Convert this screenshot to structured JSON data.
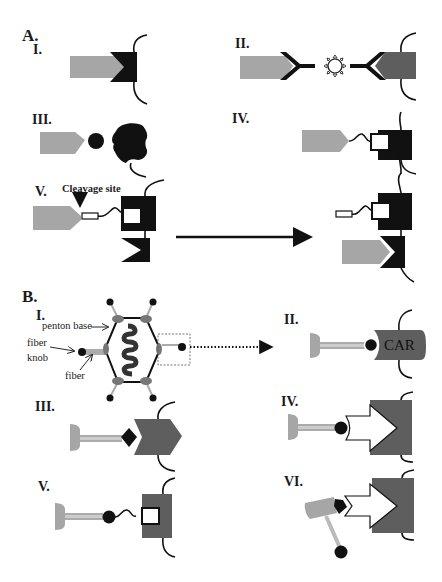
{
  "figure": {
    "sections": [
      {
        "id": "A",
        "label": "A.",
        "panels": [
          {
            "id": "A-I",
            "label": "I.",
            "description": "Light-gray arrow ligand binding into V-notch of black receptor anchored to membrane"
          },
          {
            "id": "A-II",
            "label": "II.",
            "description": "Two Y-shaped antibody adaptors bridging via a central star-shaped molecule between light-gray and dark-gray arrow shapes"
          },
          {
            "id": "A-III",
            "label": "III.",
            "description": "Light-gray arrow with black knob binding a black star-like receptor"
          },
          {
            "id": "A-IV",
            "label": "IV.",
            "description": "Light-gray arrow tethered by a wavy linker to a white square docked in black receptor"
          },
          {
            "id": "A-V",
            "label": "V.",
            "description": "Arrow attached by cleavable linker; cleavage releases ligand which then binds lower receptor"
          }
        ],
        "annotations": {
          "cleavage_site": "Cleavage site"
        }
      },
      {
        "id": "B",
        "label": "B.",
        "panels": [
          {
            "id": "B-I",
            "label": "I.",
            "description": "Adenovirus capsid with genome, penton bases and fibers with knobs"
          },
          {
            "id": "B-II",
            "label": "II.",
            "description": "Fiber knob binding CAR receptor"
          },
          {
            "id": "B-III",
            "label": "III.",
            "description": "Fiber with diamond ligand binding dark-gray chevron receptor"
          },
          {
            "id": "B-IV",
            "label": "IV.",
            "description": "Fiber knob binding an adaptor docked into dark-gray receptor"
          },
          {
            "id": "B-V",
            "label": "V.",
            "description": "Fiber knob tethered via wavy linker to white square docked in dark-gray receptor"
          },
          {
            "id": "B-VI",
            "label": "VI.",
            "description": "Displaced fiber with detached knob; adaptor bound to receptor"
          }
        ],
        "annotations": {
          "penton_base": "penton base",
          "fiber_knob_line1": "fiber",
          "fiber_knob_line2": "knob",
          "fiber": "fiber",
          "car": "CAR"
        }
      }
    ],
    "colors": {
      "light_gray": "#a6a6a6",
      "dark_gray": "#5e5e5e",
      "black": "#111111",
      "capsid_patch": "#777777",
      "background": "#ffffff"
    }
  }
}
